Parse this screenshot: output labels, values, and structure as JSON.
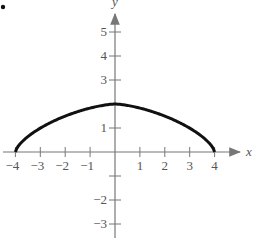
{
  "chart_data": {
    "type": "line",
    "title": "",
    "xlabel": "x",
    "ylabel": "y",
    "xlim": [
      -4.4,
      5
    ],
    "ylim": [
      -3.6,
      5.6
    ],
    "x_ticks": [
      -4,
      -3,
      -2,
      -1,
      1,
      2,
      3,
      4
    ],
    "y_ticks": [
      -3,
      -2,
      -1,
      1,
      2,
      3,
      4,
      5
    ],
    "x_tick_labels": [
      "−4",
      "−3",
      "−2",
      "−1",
      "1",
      "2",
      "3",
      "4"
    ],
    "y_tick_labels": [
      "−3",
      "−2",
      "1",
      "3",
      "4",
      "5"
    ],
    "grid": false,
    "series": [
      {
        "name": "curve",
        "x": [
          -4,
          -3.5,
          -3,
          -2.5,
          -2,
          -1.5,
          -1,
          -0.5,
          0,
          0.5,
          1,
          1.5,
          2,
          2.5,
          3,
          3.5,
          4
        ],
        "values": [
          0,
          0.97,
          1.32,
          1.56,
          1.73,
          1.85,
          1.93,
          1.98,
          2,
          1.98,
          1.93,
          1.85,
          1.73,
          1.56,
          1.32,
          0.97,
          0
        ]
      }
    ]
  }
}
